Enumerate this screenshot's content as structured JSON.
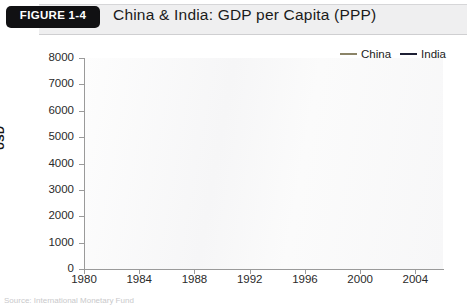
{
  "header": {
    "figure_tag": "FIGURE 1-4",
    "title": "China & India: GDP per Capita (PPP)"
  },
  "legend": {
    "position": "top-right",
    "items": [
      {
        "label": "China",
        "color": "#8b8468"
      },
      {
        "label": "India",
        "color": "#1d1f34"
      }
    ]
  },
  "caption": "Source: International Monetary Fund",
  "chart_data": {
    "type": "line",
    "title": "China & India: GDP per Capita (PPP)",
    "xlabel": "",
    "ylabel": "USD",
    "xlim": [
      1980,
      2006
    ],
    "ylim": [
      0,
      8000
    ],
    "grid": false,
    "legend_position": "top-right",
    "x_ticks": [
      1980,
      1984,
      1988,
      1992,
      1996,
      2000,
      2004
    ],
    "y_ticks": [
      0,
      1000,
      2000,
      3000,
      4000,
      5000,
      6000,
      7000,
      8000
    ],
    "x": [
      1980,
      1981,
      1982,
      1983,
      1984,
      1985,
      1986,
      1987,
      1988,
      1989,
      1990,
      1991,
      1992,
      1993,
      1994,
      1995,
      1996,
      1997,
      1998,
      1999,
      2000,
      2001,
      2002,
      2003,
      2004,
      2005,
      2006
    ],
    "series": [
      {
        "name": "China",
        "color": "#8b8468",
        "values": [
          450,
          490,
          540,
          600,
          680,
          760,
          830,
          910,
          1010,
          1080,
          1130,
          1250,
          1420,
          1620,
          1830,
          2040,
          2250,
          2460,
          2650,
          2860,
          3120,
          3400,
          3750,
          4200,
          4780,
          5700,
          6800
        ]
      },
      {
        "name": "India",
        "color": "#1d1f34",
        "values": [
          660,
          690,
          720,
          780,
          820,
          870,
          910,
          950,
          1040,
          1110,
          1180,
          1210,
          1270,
          1330,
          1410,
          1500,
          1600,
          1670,
          1760,
          1870,
          1960,
          2060,
          2140,
          2310,
          2530,
          2800,
          3550
        ]
      }
    ]
  }
}
